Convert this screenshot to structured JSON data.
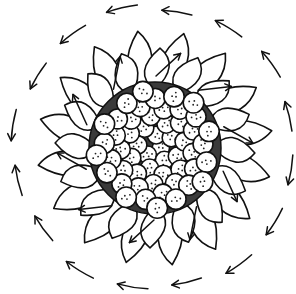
{
  "illustration": {
    "subject": "sunflower line drawing with circular rotation arrows",
    "style": "black ink on white",
    "colors": {
      "ink": "#111111",
      "paper": "#ffffff",
      "disk_fill": "#3a3a3a"
    },
    "center": [
      155,
      148
    ],
    "disk_radius": 66,
    "petals": {
      "inner_ring_count": 16,
      "outer_ring_count": 16,
      "inner_length": 100,
      "outer_length": 118
    },
    "seed_count_approx": 55,
    "inner_petal_arrows": {
      "count": 10,
      "direction": "outward-clockwise"
    },
    "outer_arrows": {
      "count": 16,
      "radius": 142,
      "direction": "counterclockwise-top / clockwise-bottom (circulating)"
    }
  }
}
